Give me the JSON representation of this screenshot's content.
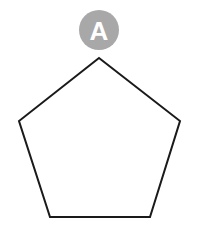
{
  "figure": {
    "canvas": {
      "width": 199,
      "height": 228,
      "background_color": "#FFFFFF"
    },
    "shape": {
      "name": "pentagon",
      "sides": 5,
      "fill_color": "#FFFFFF",
      "stroke_color": "#1A1A1A",
      "stroke_width": 2,
      "points": "99,58 180,121 150,217 50,217 19,121",
      "vertices": [
        {
          "label": "apex",
          "x": 99,
          "y": 58
        },
        {
          "label": "right",
          "x": 180,
          "y": 121
        },
        {
          "label": "bottom-right",
          "x": 150,
          "y": 217
        },
        {
          "label": "bottom-left",
          "x": 50,
          "y": 217
        },
        {
          "label": "left",
          "x": 19,
          "y": 121
        }
      ]
    },
    "badge": {
      "label": "A",
      "fill_color": "#A8A8A8",
      "text_color": "#FFFFFF",
      "center_x": 99,
      "center_y": 30,
      "radius": 20
    }
  }
}
